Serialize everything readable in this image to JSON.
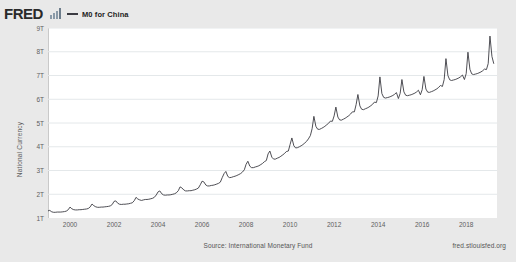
{
  "brand": {
    "logo_text": "FRED",
    "logo_icon": "bar-chart-icon"
  },
  "legend": {
    "series_label": "M0 for China",
    "line_color": "#3b3b42"
  },
  "footer": {
    "source": "Source: International Monetary Fund",
    "url": "fred.stlouisfed.org"
  },
  "chart_data": {
    "type": "line",
    "title": "M0 for China",
    "xlabel": "",
    "ylabel": "National Currency",
    "ylim": [
      1,
      9
    ],
    "xlim": [
      1999.0,
      2019.4
    ],
    "ytick_labels": [
      "9T",
      "8T",
      "7T",
      "6T",
      "5T",
      "4T",
      "3T",
      "2T",
      "1T"
    ],
    "ytick_values": [
      9,
      8,
      7,
      6,
      5,
      4,
      3,
      2,
      1
    ],
    "xtick_labels": [
      "2000",
      "2002",
      "2004",
      "2006",
      "2008",
      "2010",
      "2012",
      "2014",
      "2016",
      "2018"
    ],
    "xtick_values": [
      2000,
      2002,
      2004,
      2006,
      2008,
      2010,
      2012,
      2014,
      2016,
      2018
    ],
    "grid": "horizontal",
    "legend_position": "top-left",
    "units": "Trillions of National Currency (CNY)",
    "frequency": "Monthly",
    "series": [
      {
        "name": "M0 for China",
        "color": "#3b3b42",
        "x": [
          1999.0,
          1999.08,
          1999.17,
          1999.25,
          1999.33,
          1999.42,
          1999.5,
          1999.58,
          1999.67,
          1999.75,
          1999.83,
          1999.92,
          2000.0,
          2000.08,
          2000.17,
          2000.25,
          2000.33,
          2000.42,
          2000.5,
          2000.58,
          2000.67,
          2000.75,
          2000.83,
          2000.92,
          2001.0,
          2001.08,
          2001.17,
          2001.25,
          2001.33,
          2001.42,
          2001.5,
          2001.58,
          2001.67,
          2001.75,
          2001.83,
          2001.92,
          2002.0,
          2002.08,
          2002.17,
          2002.25,
          2002.33,
          2002.42,
          2002.5,
          2002.58,
          2002.67,
          2002.75,
          2002.83,
          2002.92,
          2003.0,
          2003.08,
          2003.17,
          2003.25,
          2003.33,
          2003.42,
          2003.5,
          2003.58,
          2003.67,
          2003.75,
          2003.83,
          2003.92,
          2004.0,
          2004.08,
          2004.17,
          2004.25,
          2004.33,
          2004.42,
          2004.5,
          2004.58,
          2004.67,
          2004.75,
          2004.83,
          2004.92,
          2005.0,
          2005.08,
          2005.17,
          2005.25,
          2005.33,
          2005.42,
          2005.5,
          2005.58,
          2005.67,
          2005.75,
          2005.83,
          2005.92,
          2006.0,
          2006.08,
          2006.17,
          2006.25,
          2006.33,
          2006.42,
          2006.5,
          2006.58,
          2006.67,
          2006.75,
          2006.83,
          2006.92,
          2007.0,
          2007.08,
          2007.17,
          2007.25,
          2007.33,
          2007.42,
          2007.5,
          2007.58,
          2007.67,
          2007.75,
          2007.83,
          2007.92,
          2008.0,
          2008.08,
          2008.17,
          2008.25,
          2008.33,
          2008.42,
          2008.5,
          2008.58,
          2008.67,
          2008.75,
          2008.83,
          2008.92,
          2009.0,
          2009.08,
          2009.17,
          2009.25,
          2009.33,
          2009.42,
          2009.5,
          2009.58,
          2009.67,
          2009.75,
          2009.83,
          2009.92,
          2010.0,
          2010.08,
          2010.17,
          2010.25,
          2010.33,
          2010.42,
          2010.5,
          2010.58,
          2010.67,
          2010.75,
          2010.83,
          2010.92,
          2011.0,
          2011.08,
          2011.17,
          2011.25,
          2011.33,
          2011.42,
          2011.5,
          2011.58,
          2011.67,
          2011.75,
          2011.83,
          2011.92,
          2012.0,
          2012.08,
          2012.17,
          2012.25,
          2012.33,
          2012.42,
          2012.5,
          2012.58,
          2012.67,
          2012.75,
          2012.83,
          2012.92,
          2013.0,
          2013.08,
          2013.17,
          2013.25,
          2013.33,
          2013.42,
          2013.5,
          2013.58,
          2013.67,
          2013.75,
          2013.83,
          2013.92,
          2014.0,
          2014.08,
          2014.17,
          2014.25,
          2014.33,
          2014.42,
          2014.5,
          2014.58,
          2014.67,
          2014.75,
          2014.83,
          2014.92,
          2015.0,
          2015.08,
          2015.17,
          2015.25,
          2015.33,
          2015.42,
          2015.5,
          2015.58,
          2015.67,
          2015.75,
          2015.83,
          2015.92,
          2016.0,
          2016.08,
          2016.17,
          2016.25,
          2016.33,
          2016.42,
          2016.5,
          2016.58,
          2016.67,
          2016.75,
          2016.83,
          2016.92,
          2017.0,
          2017.08,
          2017.17,
          2017.25,
          2017.33,
          2017.42,
          2017.5,
          2017.58,
          2017.67,
          2017.75,
          2017.83,
          2017.92,
          2018.0,
          2018.08,
          2018.17,
          2018.25,
          2018.33,
          2018.42,
          2018.5,
          2018.58,
          2018.67,
          2018.75,
          2018.83,
          2018.92,
          2019.0,
          2019.08,
          2019.17,
          2019.25
        ],
        "values": [
          1.3,
          1.32,
          1.26,
          1.24,
          1.24,
          1.25,
          1.25,
          1.25,
          1.26,
          1.27,
          1.29,
          1.35,
          1.46,
          1.39,
          1.35,
          1.34,
          1.34,
          1.35,
          1.35,
          1.36,
          1.37,
          1.38,
          1.4,
          1.47,
          1.59,
          1.52,
          1.47,
          1.45,
          1.45,
          1.46,
          1.46,
          1.47,
          1.48,
          1.49,
          1.51,
          1.57,
          1.7,
          1.72,
          1.62,
          1.58,
          1.57,
          1.58,
          1.58,
          1.59,
          1.6,
          1.62,
          1.64,
          1.73,
          1.87,
          1.8,
          1.76,
          1.74,
          1.76,
          1.78,
          1.78,
          1.79,
          1.81,
          1.83,
          1.87,
          1.97,
          2.1,
          2.14,
          2.02,
          1.97,
          1.96,
          1.97,
          1.97,
          1.98,
          2.0,
          2.02,
          2.06,
          2.15,
          2.31,
          2.27,
          2.18,
          2.14,
          2.14,
          2.15,
          2.15,
          2.17,
          2.19,
          2.22,
          2.26,
          2.4,
          2.55,
          2.52,
          2.39,
          2.35,
          2.35,
          2.37,
          2.38,
          2.4,
          2.43,
          2.46,
          2.51,
          2.71,
          2.87,
          2.96,
          2.75,
          2.7,
          2.71,
          2.74,
          2.76,
          2.79,
          2.83,
          2.87,
          2.93,
          3.03,
          3.26,
          3.39,
          3.18,
          3.12,
          3.12,
          3.15,
          3.17,
          3.2,
          3.25,
          3.3,
          3.37,
          3.42,
          3.7,
          3.82,
          3.56,
          3.48,
          3.48,
          3.52,
          3.55,
          3.6,
          3.66,
          3.72,
          3.8,
          3.82,
          4.1,
          4.37,
          4.04,
          3.95,
          3.96,
          4.0,
          4.04,
          4.09,
          4.16,
          4.23,
          4.33,
          4.47,
          4.76,
          5.28,
          4.86,
          4.74,
          4.73,
          4.77,
          4.81,
          4.86,
          4.93,
          4.99,
          5.08,
          5.07,
          5.3,
          5.67,
          5.25,
          5.13,
          5.12,
          5.16,
          5.2,
          5.25,
          5.31,
          5.38,
          5.47,
          5.47,
          5.78,
          6.2,
          5.72,
          5.58,
          5.56,
          5.6,
          5.63,
          5.67,
          5.73,
          5.79,
          5.88,
          5.86,
          6.14,
          6.94,
          6.24,
          6.08,
          6.05,
          6.07,
          6.09,
          6.12,
          6.16,
          6.21,
          6.28,
          6.03,
          6.25,
          6.83,
          6.31,
          6.17,
          6.15,
          6.17,
          6.19,
          6.22,
          6.26,
          6.31,
          6.38,
          6.19,
          6.4,
          6.96,
          6.43,
          6.3,
          6.29,
          6.32,
          6.35,
          6.39,
          6.44,
          6.5,
          6.58,
          6.54,
          6.83,
          7.71,
          7.0,
          6.82,
          6.79,
          6.81,
          6.83,
          6.86,
          6.9,
          6.95,
          7.02,
          6.83,
          7.08,
          7.98,
          7.26,
          7.07,
          7.04,
          7.06,
          7.08,
          7.11,
          7.15,
          7.2,
          7.27,
          7.25,
          7.5,
          8.66,
          7.8,
          7.51
        ]
      }
    ]
  }
}
